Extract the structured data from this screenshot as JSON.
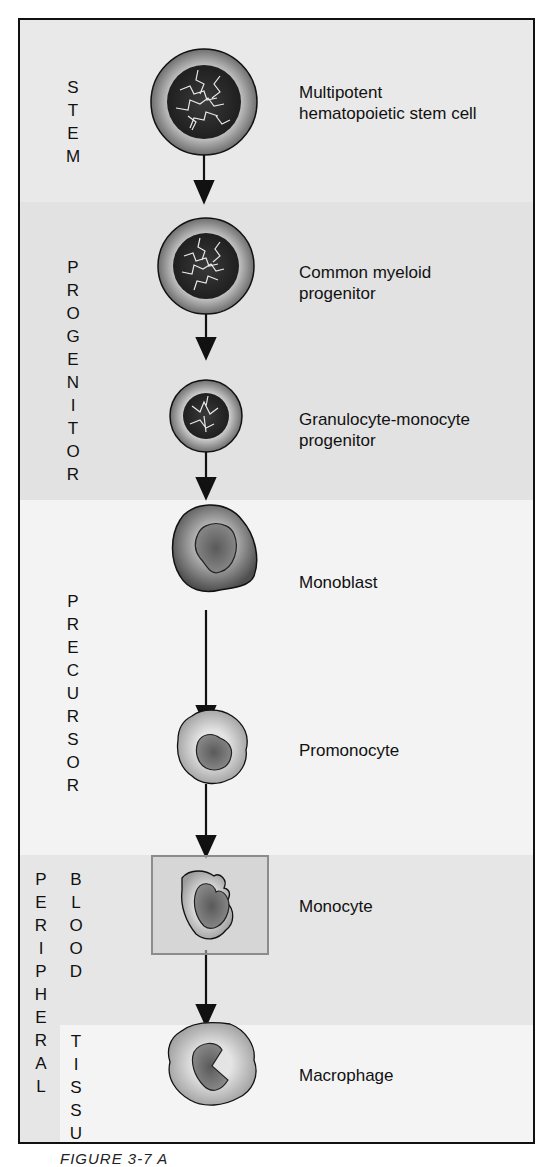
{
  "figure": {
    "caption_partial": "FIGURE 3-7 A",
    "stages": [
      {
        "id": "stem",
        "label": "STEM"
      },
      {
        "id": "progenitor",
        "label": "PROGENITOR"
      },
      {
        "id": "precursor",
        "label": "PRECURSOR"
      },
      {
        "id": "peripheral",
        "label": "PERIPHERAL"
      },
      {
        "id": "blood",
        "label": "BLOOD"
      },
      {
        "id": "tissue",
        "label": "TISSUE"
      }
    ],
    "cells": [
      {
        "name": "Multipotent",
        "name2": "hematopoietic stem cell"
      },
      {
        "name": "Common myeloid",
        "name2": "progenitor"
      },
      {
        "name": "Granulocyte-monocyte",
        "name2": "progenitor"
      },
      {
        "name": "Monoblast"
      },
      {
        "name": "Promonocyte"
      },
      {
        "name": "Monocyte"
      },
      {
        "name": "Macrophage"
      }
    ]
  }
}
